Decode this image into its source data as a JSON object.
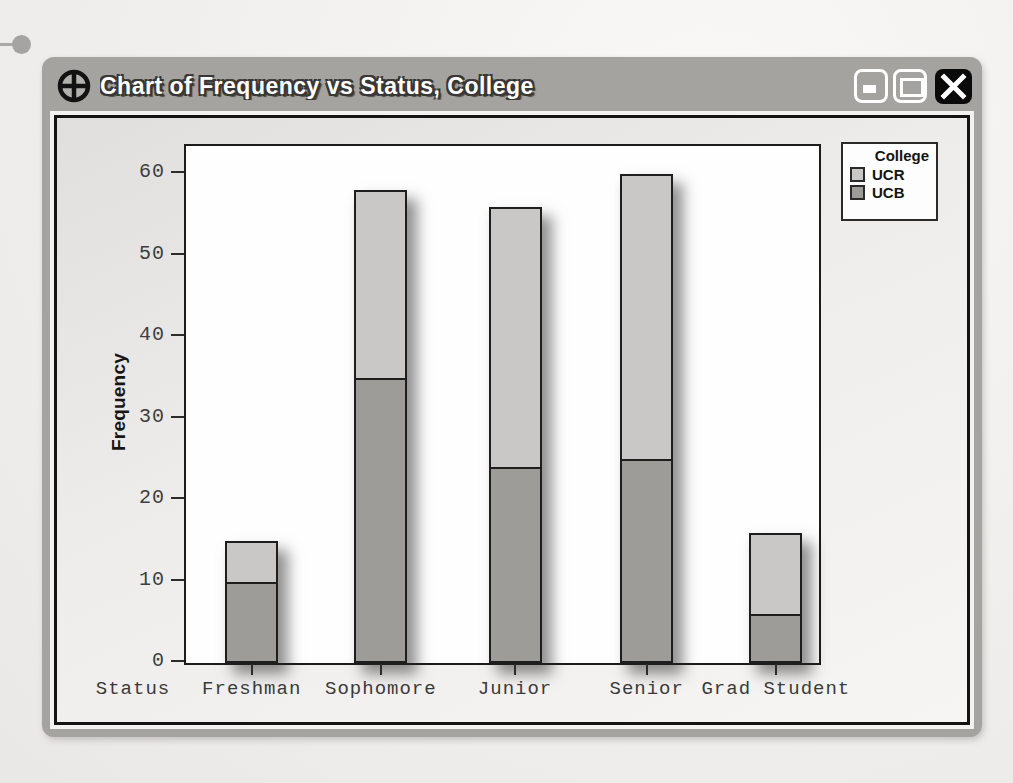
{
  "window": {
    "title": "Chart of Frequency vs Status, College",
    "icon": "crosshair-circle-chart-icon",
    "buttons": {
      "minimize": "minimize",
      "maximize": "maximize",
      "close": "close"
    }
  },
  "colors": {
    "frame_gray": "#a5a3a0",
    "ucr_light_gray": "#c9c8c6",
    "ucb_dark_gray": "#9d9c99",
    "bar_outline": "#1e1e1e",
    "close_button_black": "#0a0a0a"
  },
  "chart_data": {
    "type": "bar",
    "stacked": true,
    "title": "",
    "xlabel": "Status",
    "ylabel": "Frequency",
    "categories": [
      "Freshman",
      "Sophomore",
      "Junior",
      "Senior",
      "Grad Student"
    ],
    "series": [
      {
        "name": "UCB",
        "values": [
          10,
          35,
          24,
          25,
          6
        ],
        "color": "#9d9c99"
      },
      {
        "name": "UCR",
        "values": [
          5,
          23,
          32,
          35,
          10
        ],
        "color": "#c9c8c6"
      }
    ],
    "totals": [
      15,
      58,
      56,
      60,
      16
    ],
    "ylim": [
      0,
      63
    ],
    "yticks": [
      0,
      10,
      20,
      30,
      40,
      50,
      60
    ],
    "grid": false,
    "legend": {
      "title": "College",
      "position": "top-right",
      "entries": [
        {
          "label": "UCR",
          "color": "#c9c8c6"
        },
        {
          "label": "UCB",
          "color": "#9d9c99"
        }
      ]
    }
  }
}
